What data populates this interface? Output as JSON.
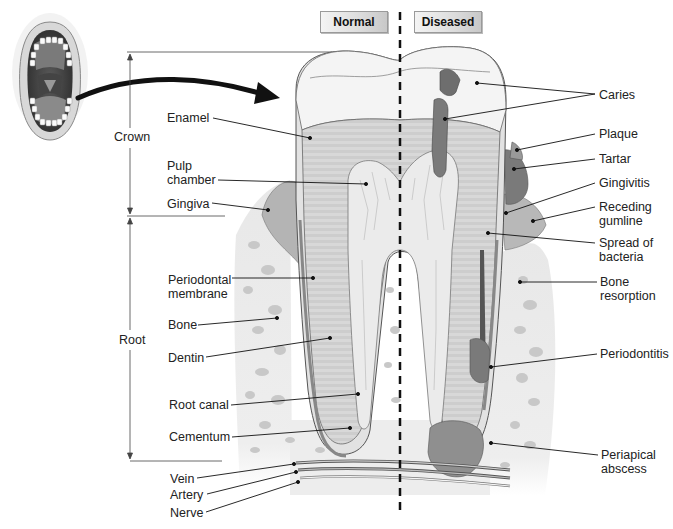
{
  "headers": {
    "normal": "Normal",
    "diseased": "Diseased"
  },
  "dimension_labels": {
    "crown": "Crown",
    "root": "Root"
  },
  "left_labels": [
    {
      "id": "enamel",
      "text": "Enamel"
    },
    {
      "id": "pulp-chamber",
      "text": "Pulp\nchamber"
    },
    {
      "id": "gingiva",
      "text": "Gingiva"
    },
    {
      "id": "periodontal-membrane",
      "text": "Periodontal\nmembrane"
    },
    {
      "id": "bone",
      "text": "Bone"
    },
    {
      "id": "dentin",
      "text": "Dentin"
    },
    {
      "id": "root-canal",
      "text": "Root canal"
    },
    {
      "id": "cementum",
      "text": "Cementum"
    },
    {
      "id": "vein",
      "text": "Vein"
    },
    {
      "id": "artery",
      "text": "Artery"
    },
    {
      "id": "nerve",
      "text": "Nerve"
    }
  ],
  "right_labels": [
    {
      "id": "caries",
      "text": "Caries"
    },
    {
      "id": "plaque",
      "text": "Plaque"
    },
    {
      "id": "tartar",
      "text": "Tartar"
    },
    {
      "id": "gingivitis",
      "text": "Gingivitis"
    },
    {
      "id": "receding-gumline",
      "text": "Receding\ngumline"
    },
    {
      "id": "spread-of-bacteria",
      "text": "Spread of\nbacteria"
    },
    {
      "id": "bone-resorption",
      "text": "Bone\nresorption"
    },
    {
      "id": "periodontitis",
      "text": "Periodontitis"
    },
    {
      "id": "periapical-abscess",
      "text": "Periapical\nabscess"
    }
  ],
  "colors": {
    "enamel": "#f3f3f3",
    "dentin": "#cfcfcf",
    "pulp": "#e6e6e6",
    "decay": "#6e6e6e",
    "gum": "#a9a9a9",
    "bone": "#ececec",
    "bone_spots": "#c4c4c4",
    "line": "#222222"
  }
}
